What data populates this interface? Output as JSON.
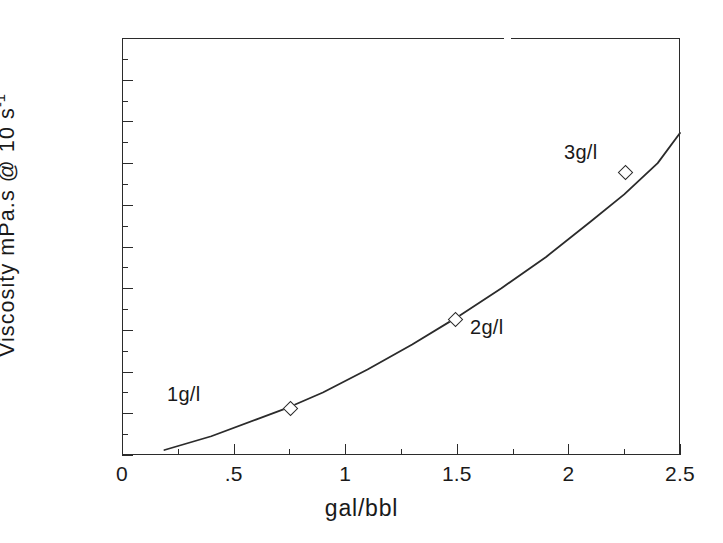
{
  "chart_data": {
    "type": "line",
    "title": "",
    "subtitle": "",
    "xlabel": "gal/bbl",
    "ylabel": "Viscosity mPa.s @ 10 s",
    "ylabel_exponent": "-1",
    "ylabel_full": "Viscosity mPa.s @ 10 s-1",
    "xlim": [
      0,
      2.5
    ],
    "ylim": [
      0,
      1000
    ],
    "grid": false,
    "legend": "none",
    "x_ticks": [
      "0",
      ".5",
      "1",
      "1.5",
      "2",
      "2.5"
    ],
    "x_tick_values": [
      0,
      0.5,
      1,
      1.5,
      2,
      2.5
    ],
    "x_minor_tick_values": [
      0.25,
      0.75,
      1.25,
      1.75,
      2.25
    ],
    "y_ticks": [
      "0",
      "100",
      "200",
      "300",
      "400",
      "500",
      "600",
      "700",
      "800",
      "900",
      "1000"
    ],
    "y_tick_values": [
      0,
      100,
      200,
      300,
      400,
      500,
      600,
      700,
      800,
      900,
      1000
    ],
    "y_minor_tick_values": [
      50,
      150,
      250,
      350,
      450,
      550,
      650,
      750,
      850,
      950
    ],
    "series": [
      {
        "name": "fitted curve",
        "style": "solid-line",
        "x": [
          0.19,
          0.4,
          0.6,
          0.75,
          0.9,
          1.1,
          1.3,
          1.5,
          1.7,
          1.9,
          2.1,
          2.25,
          2.4,
          2.5
        ],
        "y": [
          12,
          45,
          85,
          115,
          150,
          205,
          265,
          330,
          400,
          475,
          560,
          625,
          700,
          772
        ]
      }
    ],
    "points": [
      {
        "label": "1g/l",
        "x": 0.75,
        "y": 115
      },
      {
        "label": "2g/l",
        "x": 1.49,
        "y": 328
      },
      {
        "label": "3g/l",
        "x": 2.25,
        "y": 679
      }
    ],
    "marker_shape": "open-diamond",
    "line_color": "#2b2b2b",
    "background_color": "#ffffff"
  }
}
